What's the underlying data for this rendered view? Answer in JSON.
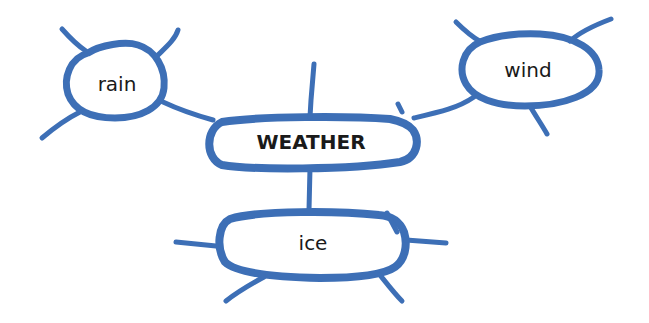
{
  "diagram": {
    "type": "mind-map",
    "stroke_color": "#3d6fb6",
    "text_color": "#1a1a1a",
    "center": {
      "label": "WEATHER"
    },
    "nodes": [
      {
        "id": "rain",
        "label": "rain"
      },
      {
        "id": "wind",
        "label": "wind"
      },
      {
        "id": "ice",
        "label": "ice"
      }
    ],
    "edges": [
      {
        "from": "WEATHER",
        "to": "rain"
      },
      {
        "from": "WEATHER",
        "to": "wind"
      },
      {
        "from": "WEATHER",
        "to": "ice"
      }
    ]
  }
}
